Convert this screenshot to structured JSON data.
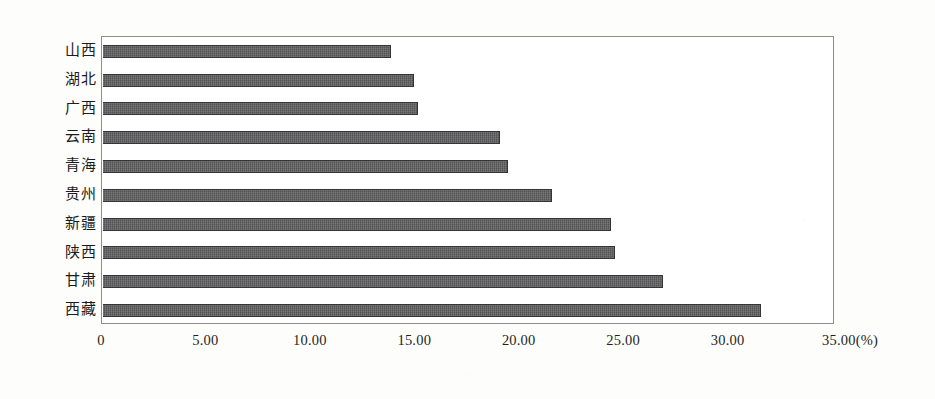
{
  "chart_data": {
    "type": "bar",
    "orientation": "horizontal",
    "title": "",
    "subtitle": "",
    "xlabel": "(%)",
    "ylabel": "",
    "categories": [
      "山西",
      "湖北",
      "广西",
      "云南",
      "青海",
      "贵州",
      "新疆",
      "陕西",
      "甘肃",
      "西藏"
    ],
    "values": [
      13.8,
      14.9,
      15.1,
      19.0,
      19.4,
      21.5,
      24.3,
      24.5,
      26.8,
      31.5
    ],
    "series": [
      {
        "name": "",
        "values": [
          13.8,
          14.9,
          15.1,
          19.0,
          19.4,
          21.5,
          24.3,
          24.5,
          26.8,
          31.5
        ]
      }
    ],
    "xlim": [
      0,
      35
    ],
    "xticks": [
      0,
      5,
      10,
      15,
      20,
      25,
      30,
      35
    ],
    "xtick_labels": [
      "0",
      "5.00",
      "10.00",
      "15.00",
      "20.00",
      "25.00",
      "30.00",
      "35.00"
    ],
    "unit_label": "(%)",
    "grid": false,
    "legend": false,
    "legend_position": "none",
    "bar_color": "#5b5b5d",
    "bar_border_color": "#343436",
    "frame_color": "#8e8e8e",
    "plot_background": "#ffffff",
    "page_background": "#fdfdfb"
  },
  "axis": {
    "x_unit_suffix": "(%)",
    "x_min_label": "0",
    "x_max_label": "35.00"
  }
}
